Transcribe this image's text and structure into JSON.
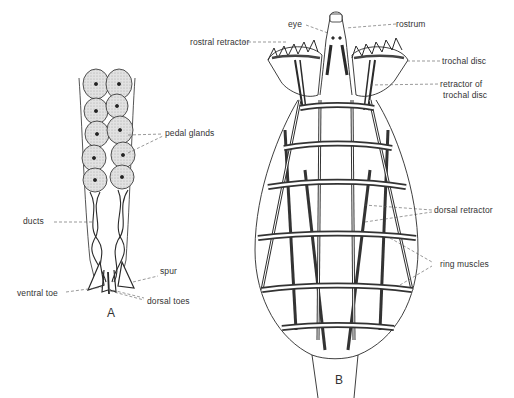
{
  "figure": {
    "panels": [
      {
        "id": "A",
        "letter": "A",
        "subject": "foot with pedal glands",
        "labels": {
          "pedal_glands": "pedal glands",
          "ducts": "ducts",
          "spur": "spur",
          "ventral_toe": "ventral toe",
          "dorsal_toes": "dorsal toes"
        }
      },
      {
        "id": "B",
        "letter": "B",
        "subject": "body musculature",
        "labels": {
          "eye": "eye",
          "rostrum": "rostrum",
          "trochal_disc": "trochal disc",
          "rostral_retractor": "rostral retractor",
          "retractor_of_trochal_disc_1": "retractor of",
          "retractor_of_trochal_disc_2": "trochal disc",
          "dorsal_retractor": "dorsal retractor",
          "ring_muscles": "ring muscles"
        }
      }
    ],
    "colors": {
      "ink": "#2a2a2a",
      "gland_fill": "#d9d9d9",
      "background": "#ffffff"
    }
  }
}
